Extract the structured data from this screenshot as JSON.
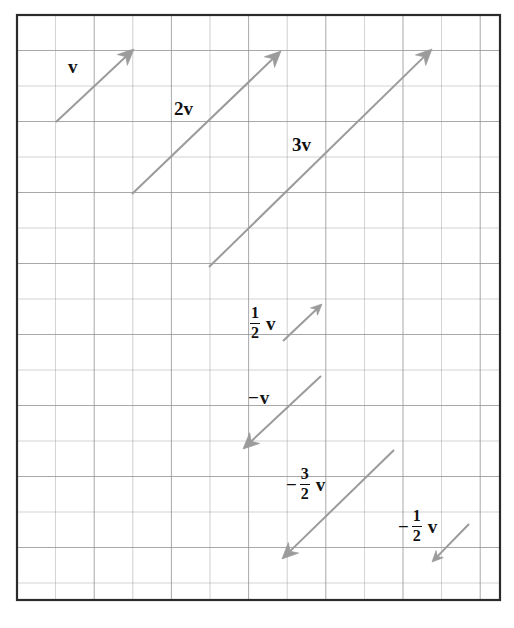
{
  "figure": {
    "type": "vector-diagram",
    "canvas": {
      "width": 514,
      "height": 628
    },
    "grid": {
      "box": {
        "x": 17,
        "y": 15,
        "width": 483,
        "height": 585
      },
      "cell_width": 38.6,
      "cell_height": 35.5,
      "columns": 12,
      "rows": 16,
      "line_color": "#8e8e92",
      "border_color": "#2b2b2b",
      "border_width": 2.2
    },
    "vector_color": "#9b9b9b",
    "vector_width": 2.0,
    "label_color": "#111111",
    "vectors": [
      {
        "id": "v",
        "label_parts": {
          "sign": "",
          "coefficient": "",
          "fraction": null,
          "symbol": "v"
        },
        "label_text": "v",
        "scalar": 1,
        "start": {
          "x": 56,
          "y": 122
        },
        "end": {
          "x": 134,
          "y": 49
        },
        "label_pos": {
          "x": 68,
          "y": 57
        }
      },
      {
        "id": "2v",
        "label_parts": {
          "sign": "",
          "coefficient": "2",
          "fraction": null,
          "symbol": "v"
        },
        "label_text": "2v",
        "scalar": 2,
        "start": {
          "x": 132,
          "y": 194
        },
        "end": {
          "x": 281,
          "y": 51
        },
        "label_pos": {
          "x": 174,
          "y": 99
        }
      },
      {
        "id": "3v",
        "label_parts": {
          "sign": "",
          "coefficient": "3",
          "fraction": null,
          "symbol": "v"
        },
        "label_text": "3v",
        "scalar": 3,
        "start": {
          "x": 209,
          "y": 267
        },
        "end": {
          "x": 432,
          "y": 49
        },
        "label_pos": {
          "x": 292,
          "y": 135
        }
      },
      {
        "id": "half-v",
        "label_parts": {
          "sign": "",
          "coefficient": "",
          "fraction": {
            "numerator": "1",
            "denominator": "2"
          },
          "symbol": "v"
        },
        "label_text": "1/2 v",
        "scalar": 0.5,
        "start": {
          "x": 283,
          "y": 341
        },
        "end": {
          "x": 322,
          "y": 304
        },
        "label_pos": {
          "x": 248,
          "y": 305
        }
      },
      {
        "id": "neg-v",
        "label_parts": {
          "sign": "−",
          "coefficient": "",
          "fraction": null,
          "symbol": "v"
        },
        "label_text": "−v",
        "scalar": -1,
        "start": {
          "x": 321,
          "y": 376
        },
        "end": {
          "x": 243,
          "y": 449
        },
        "label_pos": {
          "x": 248,
          "y": 388
        }
      },
      {
        "id": "neg-three-halves-v",
        "label_parts": {
          "sign": "−",
          "coefficient": "",
          "fraction": {
            "numerator": "3",
            "denominator": "2"
          },
          "symbol": "v"
        },
        "label_text": "−3/2 v",
        "scalar": -1.5,
        "start": {
          "x": 394,
          "y": 450
        },
        "end": {
          "x": 282,
          "y": 559
        },
        "label_pos": {
          "x": 286,
          "y": 466
        }
      },
      {
        "id": "neg-half-v",
        "label_parts": {
          "sign": "−",
          "coefficient": "",
          "fraction": {
            "numerator": "1",
            "denominator": "2"
          },
          "symbol": "v"
        },
        "label_text": "−1/2 v",
        "scalar": -0.5,
        "start": {
          "x": 469,
          "y": 524
        },
        "end": {
          "x": 432,
          "y": 562
        },
        "label_pos": {
          "x": 398,
          "y": 508
        }
      }
    ]
  }
}
